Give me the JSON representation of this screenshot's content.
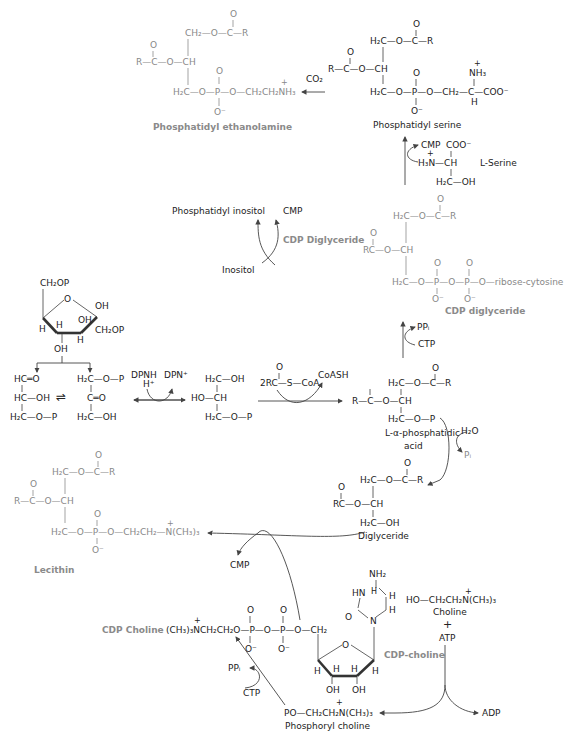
{
  "phosphatidyl_ethanolamine": {
    "name": "Phosphatidyl ethanolamine",
    "o_top": "O",
    "ch2_ester": "CH₂—O—C—R",
    "o_left": "O",
    "r_c_o_ch": "R—C—O—CH",
    "o_p": "O",
    "backbone": "H₂C—O—P—O—CH₂CH₂NH₃",
    "plus": "+",
    "o_minus": "O⁻",
    "co2": "CO₂"
  },
  "phosphatidyl_serine": {
    "name": "Phosphatidyl serine",
    "o_top": "O",
    "ester": "H₂C—O—C—R",
    "o_left": "O",
    "r_c_o_ch": "R—C—O—CH",
    "o_p": "O",
    "nh3": "NH₃",
    "plus": "+",
    "backbone": "H₂C—O—P—O—CH₂—C—COO⁻",
    "h": "H",
    "o_minus": "O⁻"
  },
  "serine_step": {
    "cmp": "CMP",
    "coo": "COO⁻",
    "h3n_ch": "H₃N—CH",
    "plus": "+",
    "h2c_oh": "H₂C—OH",
    "label": "L-Serine"
  },
  "inositol_step": {
    "product": "Phosphatidyl inositol",
    "cmp": "CMP",
    "reactant": "Inositol",
    "enzyme_label": "CDP Diglyceride"
  },
  "cdp_diglyceride": {
    "name": "CDP diglyceride",
    "o_top": "O",
    "ester": "H₂C—O—C—R",
    "o_left": "O",
    "rc_o_ch": "RC—O—CH",
    "o_p1": "O",
    "o_p2": "O",
    "backbone": "H₂C—O—P—O—P—O—ribose-cytosine",
    "o_minus1": "O⁻",
    "o_minus2": "O⁻",
    "ppi": "PPᵢ",
    "ctp": "CTP"
  },
  "fructose_diphosphate": {
    "ch2op_top": "CH₂OP",
    "ring_o": "O",
    "oh_right": "OH",
    "oh_mid": "OH",
    "ch2op_right": "CH₂OP",
    "h_left": "H",
    "h_inner": "H",
    "h_bottom": "H",
    "oh_bottom": "OH"
  },
  "triose": {
    "gald_1": "HC═O",
    "gald_2": "HC—OH",
    "gald_3": "H₂C—O—P",
    "equilibrium": "⇌",
    "dhap_1": "H₂C—O—P",
    "dhap_2": "C═O",
    "dhap_3": "H₂C—OH",
    "dpnh": "DPNH",
    "hplus": "H⁺",
    "dpn": "DPN⁺",
    "g3p_1": "H₂C—OH",
    "g3p_2": "HO—CH",
    "g3p_3": "H₂C—O—P"
  },
  "acylation": {
    "o": "O",
    "reactant": "2RC—S—CoA",
    "coash": "CoASH"
  },
  "phosphatidic_acid": {
    "name_line1": "L-α-phosphatidic",
    "name_line2": "acid",
    "o_top": "O",
    "ester": "H₂C—O—C—R",
    "o_left": "O",
    "r_c_o_ch": "R—C—O—CH",
    "bottom": "H₂C—O—P",
    "h2o": "H₂O",
    "pi": "Pᵢ"
  },
  "diglyceride": {
    "name": "Diglyceride",
    "o_top": "O",
    "ester": "H₂C—O—C—R",
    "o_left": "O",
    "rc_o_ch": "RC—O—CH",
    "bottom": "H₂C—OH"
  },
  "lecithin": {
    "name": "Lecithin",
    "o_top": "O",
    "ester": "H₂C—O—C—R",
    "o_left": "O",
    "r_c_o_ch": "R—C—O—CH",
    "o_p": "O",
    "backbone": "H₂C—O—P—O—CH₂CH₂—N(CH₃)₃",
    "plus": "+",
    "o_minus": "O⁻",
    "cmp": "CMP"
  },
  "cdp_choline": {
    "label_left": "CDP Choline",
    "label_right": "CDP-choline",
    "chain": "(CH₃)₃NCH₂CH₂O—P—O—P—O—CH₂",
    "plus": "+",
    "o_p1": "O",
    "o_p2": "O",
    "o_minus1": "O⁻",
    "o_minus2": "O⁻",
    "nh2": "NH₂",
    "hn": "HN",
    "h_ring1": "H",
    "h_ring2": "H",
    "h_ring3": "H",
    "o_ring": "O",
    "n_ring": "N",
    "c_o": "O",
    "ribose_o": "O",
    "h_a": "H",
    "h_b": "H",
    "h_c": "H",
    "h_d": "H",
    "oh_1": "OH",
    "oh_2": "OH",
    "ppi": "PPᵢ",
    "ctp": "CTP"
  },
  "choline": {
    "formula": "HO—CH₂CH₂N(CH₃)₃",
    "plus": "+",
    "name": "Choline",
    "plus_sign": "+",
    "atp": "ATP",
    "adp": "ADP"
  },
  "phosphoryl_choline": {
    "formula": "PO—CH₂CH₂N(CH₃)₃",
    "plus": "+",
    "name": "Phosphoryl choline"
  },
  "colors": {
    "text": "#222222",
    "gray_label": "#8a8a8a",
    "line": "#555555"
  }
}
